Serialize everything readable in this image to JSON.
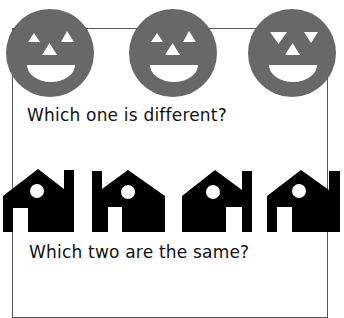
{
  "worksheet": {
    "question_1": "Which one is different?",
    "question_2": "Which two are the same?",
    "colors": {
      "face_fill": "#686868",
      "feature_fill": "#ffffff",
      "house_fill": "#000000",
      "frame_border": "#555555"
    },
    "faces": [
      {
        "id": "face-1",
        "eyes": "up"
      },
      {
        "id": "face-2",
        "eyes": "up"
      },
      {
        "id": "face-3",
        "eyes": "down"
      }
    ],
    "houses": [
      {
        "id": "house-1",
        "chimney": "right",
        "door": "left"
      },
      {
        "id": "house-2",
        "chimney": "left",
        "door": "left"
      },
      {
        "id": "house-3",
        "chimney": "right",
        "door": "right"
      },
      {
        "id": "house-4",
        "chimney": "right",
        "door": "left"
      }
    ]
  }
}
